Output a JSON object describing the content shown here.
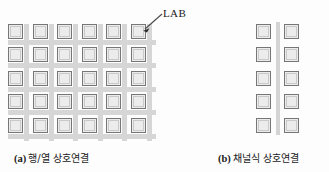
{
  "figure": {
    "background_color": "#fdfdfd",
    "lab_fill_color": "#ececec",
    "lab_border_color": "#767676",
    "interconnect_color": "#d6d6d6",
    "channel_color": "#d4d4d4",
    "text_color": "#1a1a1a"
  },
  "callout": {
    "label": "LAB",
    "target": "top-right-lab-panel-a"
  },
  "panel_a": {
    "caption_tag": "(a)",
    "caption_text": "행/열 상호연결",
    "columns": 6,
    "rows": 5,
    "interconnect_type": "row-column",
    "cell_pitch_x": 24.6,
    "cell_pitch_y": 23.4,
    "lab_size": 15,
    "labs": [
      {
        "row": 1,
        "col": 1
      },
      {
        "row": 1,
        "col": 2
      },
      {
        "row": 1,
        "col": 3
      },
      {
        "row": 1,
        "col": 4
      },
      {
        "row": 1,
        "col": 5
      },
      {
        "row": 1,
        "col": 6
      },
      {
        "row": 2,
        "col": 1
      },
      {
        "row": 2,
        "col": 2
      },
      {
        "row": 2,
        "col": 3
      },
      {
        "row": 2,
        "col": 4
      },
      {
        "row": 2,
        "col": 5
      },
      {
        "row": 2,
        "col": 6
      },
      {
        "row": 3,
        "col": 1
      },
      {
        "row": 3,
        "col": 2
      },
      {
        "row": 3,
        "col": 3
      },
      {
        "row": 3,
        "col": 4
      },
      {
        "row": 3,
        "col": 5
      },
      {
        "row": 3,
        "col": 6
      },
      {
        "row": 4,
        "col": 1
      },
      {
        "row": 4,
        "col": 2
      },
      {
        "row": 4,
        "col": 3
      },
      {
        "row": 4,
        "col": 4
      },
      {
        "row": 4,
        "col": 5
      },
      {
        "row": 4,
        "col": 6
      },
      {
        "row": 5,
        "col": 1
      },
      {
        "row": 5,
        "col": 2
      },
      {
        "row": 5,
        "col": 3
      },
      {
        "row": 5,
        "col": 4
      },
      {
        "row": 5,
        "col": 5
      },
      {
        "row": 5,
        "col": 6
      }
    ]
  },
  "panel_b": {
    "caption_tag": "(b)",
    "caption_text": "채널식 상호연결",
    "columns": 2,
    "rows": 5,
    "interconnect_type": "channel",
    "cell_pitch_x": 28,
    "cell_pitch_y": 23.4,
    "lab_size": 15,
    "labs": [
      {
        "row": 1,
        "col": 1
      },
      {
        "row": 1,
        "col": 2
      },
      {
        "row": 2,
        "col": 1
      },
      {
        "row": 2,
        "col": 2
      },
      {
        "row": 3,
        "col": 1
      },
      {
        "row": 3,
        "col": 2
      },
      {
        "row": 4,
        "col": 1
      },
      {
        "row": 4,
        "col": 2
      },
      {
        "row": 5,
        "col": 1
      },
      {
        "row": 5,
        "col": 2
      }
    ]
  }
}
